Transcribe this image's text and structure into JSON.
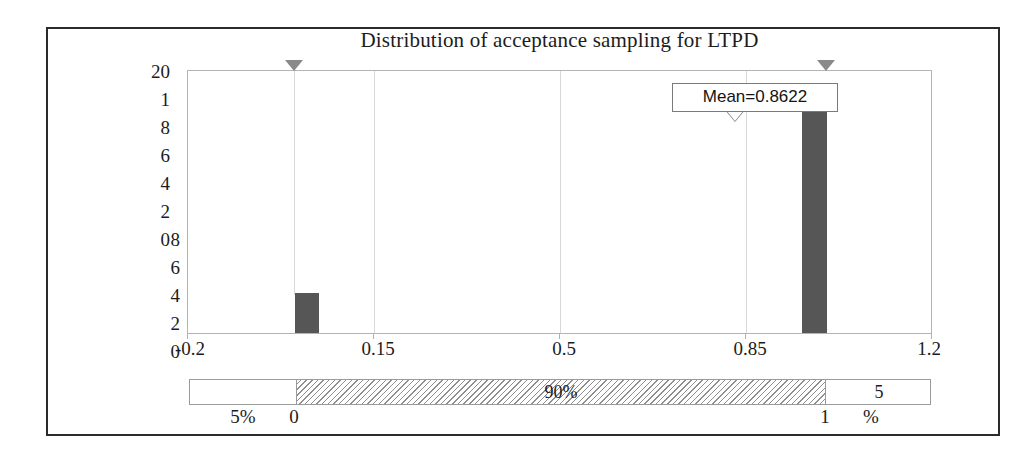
{
  "chart_data": {
    "type": "bar",
    "title": "Distribution of acceptance sampling for LTPD",
    "xlabel": "",
    "ylabel": "",
    "xlim": [
      -0.2,
      1.2
    ],
    "ylim": [
      0,
      20
    ],
    "grid": true,
    "legend": null,
    "x_ticks": [
      "-0.2",
      "0.15",
      "0.5",
      "0.85",
      "1.2"
    ],
    "x_tick_values": [
      -0.2,
      0.15,
      0.5,
      0.85,
      1.2
    ],
    "y_ticks_primary": [
      "20",
      "1",
      "8",
      "6",
      "4",
      "2",
      "0"
    ],
    "y_ticks_secondary": [
      "8",
      "6",
      "4",
      "2",
      "0"
    ],
    "y_tick_values": [
      20,
      18,
      16,
      14,
      12,
      10,
      8,
      6,
      4,
      2,
      0
    ],
    "categories": [
      "0",
      "1"
    ],
    "x": [
      0.0,
      1.0
    ],
    "values": [
      3,
      18
    ],
    "bar_color": "#565656",
    "annotations": [
      {
        "name": "mean-callout",
        "text": "Mean=0.8622",
        "value": 0.8622
      }
    ],
    "spec_markers": [
      {
        "name": "lower-spec-marker",
        "x": 0.0
      },
      {
        "name": "upper-spec-marker",
        "x": 1.0
      }
    ]
  },
  "percentage_band": {
    "segments": [
      {
        "name": "left-tail",
        "label": "",
        "percent": 5,
        "hatched": false
      },
      {
        "name": "center-band",
        "label": "90%",
        "percent": 90,
        "hatched": true
      },
      {
        "name": "right-tail",
        "label_top": "5",
        "label_bottom": "%",
        "percent": 5,
        "hatched": false
      }
    ],
    "tick_labels": [
      {
        "name": "band-label-left",
        "text": "5%"
      },
      {
        "name": "band-label-zero",
        "text": "0"
      },
      {
        "name": "band-label-one",
        "text": "1"
      },
      {
        "name": "band-label-right",
        "text": "%"
      }
    ]
  },
  "colors": {
    "bar": "#565656",
    "frame": "#2b2b2b",
    "grid": "#d8d8d8",
    "marker": "#8a8a8a",
    "hatch": "#8f8f8f"
  }
}
